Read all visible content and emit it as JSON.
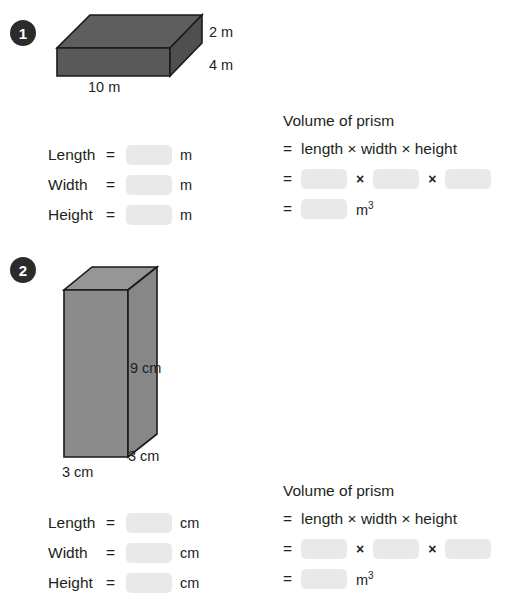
{
  "page": {
    "blank_fill_color": "#e9e9e9"
  },
  "problems": [
    {
      "number": "1",
      "figure": {
        "shape": "rectangular-prism-flat",
        "fill_front": "#595959",
        "fill_top": "#5e5e5e",
        "fill_side": "#4f4f4f",
        "stroke": "#1a1a1a",
        "dimensions": [
          {
            "name": "height",
            "text": "2 m"
          },
          {
            "name": "width",
            "text": "4 m"
          },
          {
            "name": "length",
            "text": "10 m"
          }
        ]
      },
      "fields": {
        "rows": [
          {
            "label": "Length",
            "equals": "=",
            "unit": "m"
          },
          {
            "label": "Width",
            "equals": "=",
            "unit": "m"
          },
          {
            "label": "Height",
            "equals": "=",
            "unit": "m"
          }
        ]
      },
      "formula": {
        "heading": "Volume of prism",
        "equals": "=",
        "expression": "length × width × height",
        "times_symbol": "×",
        "result_unit": "m",
        "result_exponent": "3"
      }
    },
    {
      "number": "2",
      "figure": {
        "shape": "rectangular-prism-tall",
        "fill_front": "#8c8c8c",
        "fill_top": "#969696",
        "fill_side": "#878787",
        "stroke": "#1a1a1a",
        "dimensions": [
          {
            "name": "height",
            "text": "9 cm"
          },
          {
            "name": "depth",
            "text": "3 cm"
          },
          {
            "name": "width",
            "text": "3 cm"
          }
        ]
      },
      "fields": {
        "rows": [
          {
            "label": "Length",
            "equals": "=",
            "unit": "cm"
          },
          {
            "label": "Width",
            "equals": "=",
            "unit": "cm"
          },
          {
            "label": "Height",
            "equals": "=",
            "unit": "cm"
          }
        ]
      },
      "formula": {
        "heading": "Volume of prism",
        "equals": "=",
        "expression": "length × width × height",
        "times_symbol": "×",
        "result_unit": "m",
        "result_exponent": "3"
      }
    }
  ]
}
